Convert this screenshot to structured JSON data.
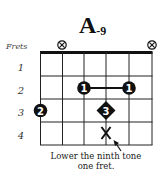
{
  "chord": {
    "name": "A",
    "suffix": "-9"
  },
  "frets_label": "Frets",
  "fret_numbers": [
    "1",
    "2",
    "3",
    "4"
  ],
  "open_muted": [
    {
      "string": 2,
      "symbol": "muted"
    },
    {
      "string": 6,
      "symbol": "muted"
    }
  ],
  "fingerings": [
    {
      "string": 1,
      "fret": 3,
      "finger": "2",
      "shape": "circle"
    },
    {
      "string": 3,
      "fret": 2,
      "finger": "1",
      "shape": "circle",
      "barre_to": 5
    },
    {
      "string": 5,
      "fret": 2,
      "finger": "1",
      "shape": "circle"
    },
    {
      "string": 4,
      "fret": 3,
      "finger": "3",
      "shape": "diamond"
    },
    {
      "string": 4,
      "fret": 4,
      "finger": "X",
      "shape": "x-mark"
    }
  ],
  "annotation": {
    "line1": "Lower the ninth tone",
    "line2": "one fret."
  },
  "colors": {
    "ink": "#111111",
    "background": "#ffffff"
  }
}
